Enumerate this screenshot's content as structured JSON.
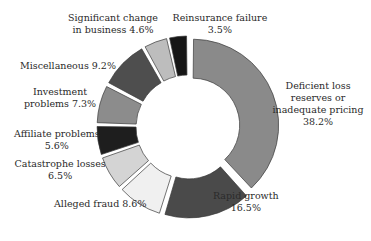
{
  "chart_data": {
    "type": "pie",
    "variant": "donut-exploded",
    "title": "",
    "slices": [
      {
        "label": "Deficient loss reserves or inadequate pricing",
        "value": 38.2,
        "color": "#8a8a8a",
        "label_lines": [
          "Deficient loss",
          "reserves or",
          "inadequate pricing",
          "38.2%"
        ]
      },
      {
        "label": "Rapid growth",
        "value": 16.5,
        "color": "#4a4a4a",
        "label_lines": [
          "Rapid growth",
          "16.5%"
        ]
      },
      {
        "label": "Alleged fraud",
        "value": 8.6,
        "color": "#f0f0f0",
        "label_lines": [
          "Alleged fraud 8.6%"
        ]
      },
      {
        "label": "Catastrophe losses",
        "value": 6.5,
        "color": "#d4d4d4",
        "label_lines": [
          "Catastrophe losses",
          "6.5%"
        ]
      },
      {
        "label": "Affiliate problems",
        "value": 5.6,
        "color": "#1e1e1e",
        "label_lines": [
          "Affiliate problems",
          "5.6%"
        ]
      },
      {
        "label": "Investment problems",
        "value": 7.3,
        "color": "#8c8c8c",
        "label_lines": [
          "Investment",
          "problems 7.3%"
        ]
      },
      {
        "label": "Miscellaneous",
        "value": 9.2,
        "color": "#4e4e4e",
        "label_lines": [
          "Miscellaneous 9.2%"
        ]
      },
      {
        "label": "Significant change in business",
        "value": 4.6,
        "color": "#bdbdbd",
        "label_lines": [
          "Significant change",
          "in business 4.6%"
        ]
      },
      {
        "label": "Reinsurance failure",
        "value": 3.5,
        "color": "#161616",
        "label_lines": [
          "Reinsurance failure",
          "3.5%"
        ]
      }
    ],
    "start_angle_deg": 0,
    "direction": "clockwise",
    "legend": "none"
  }
}
